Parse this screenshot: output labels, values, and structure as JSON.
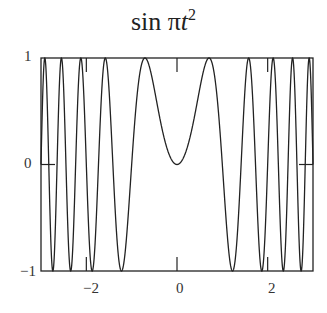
{
  "chart_data": {
    "type": "line",
    "function": "sin(pi*t^2)",
    "xlabel": "",
    "ylabel": "",
    "xlim": [
      -3,
      3
    ],
    "ylim": [
      -1,
      1
    ],
    "grid": false,
    "legend": null,
    "xticks": [
      -2,
      0,
      2
    ],
    "yticks": [
      -1,
      0,
      1
    ],
    "x": [
      -3,
      -2.5,
      -2,
      -1.5,
      -1,
      -0.5,
      0,
      0.5,
      1,
      1.5,
      2,
      2.5,
      3
    ],
    "series": [
      {
        "name": "sin πt²",
        "values": [
          0,
          0.707,
          0,
          -0.707,
          0,
          0.707,
          0,
          0.707,
          0,
          -0.707,
          0,
          0.707,
          0
        ]
      }
    ]
  },
  "title": {
    "main": "sin π",
    "var": "t",
    "exp": "2"
  },
  "labels": {
    "y_top": "1",
    "y_mid": "0",
    "y_bot": "−1",
    "x_left": "−2",
    "x_mid": "0",
    "x_right": "2"
  }
}
